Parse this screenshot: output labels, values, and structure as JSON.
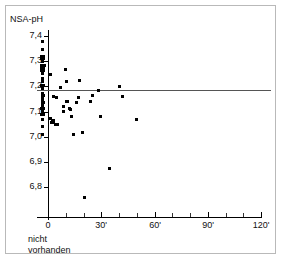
{
  "figure": {
    "kind": "scatter-plot",
    "background_color": "#ffffff",
    "frame_color": "#b9b9b9"
  },
  "labels": {
    "y_axis_title": "NSA-pH",
    "below_origin_line1": "nicht",
    "below_origin_line2": "vorhanden"
  },
  "chart_data": {
    "type": "scatter",
    "title": "",
    "subtitle": "",
    "xlabel": "",
    "ylabel": "NSA-pH",
    "grid": false,
    "legend": null,
    "xlim": [
      -12,
      128
    ],
    "ylim": [
      6.74,
      7.45
    ],
    "x_tick_labels": [
      "0",
      "30'",
      "60'",
      "90'",
      "120'"
    ],
    "x_tick_values": [
      0,
      30,
      60,
      90,
      120
    ],
    "x_minor_tick_values": [
      10,
      20,
      40,
      50,
      70,
      80,
      100,
      110
    ],
    "y_tick_labels": [
      "7,4",
      "7,3",
      "7,2",
      "7,1",
      "7,0",
      "6,9",
      "6,8"
    ],
    "y_tick_values": [
      7.4,
      7.3,
      7.2,
      7.1,
      7.0,
      6.9,
      6.8
    ],
    "annotations": [
      {
        "name": "reference-line",
        "kind": "horizontal-line",
        "y": 7.2,
        "color": "#555555",
        "label": ""
      },
      {
        "name": "category-axis-note",
        "kind": "text",
        "text": "nicht vorhanden",
        "x": 0,
        "y": 6.76
      }
    ],
    "series": [
      {
        "name": "NSA-pH measurements",
        "marker": "square",
        "color": "#000000",
        "points": [
          [
            -3.0,
            7.38
          ],
          [
            -3.0,
            7.345
          ],
          [
            -3.4,
            7.318
          ],
          [
            -2.6,
            7.318
          ],
          [
            -3.4,
            7.31
          ],
          [
            -2.6,
            7.31
          ],
          [
            -3.0,
            7.3
          ],
          [
            -3.8,
            7.283
          ],
          [
            -3.0,
            7.283
          ],
          [
            -2.2,
            7.283
          ],
          [
            -3.4,
            7.272
          ],
          [
            -2.6,
            7.272
          ],
          [
            -3.4,
            7.262
          ],
          [
            -2.6,
            7.262
          ],
          [
            -3.0,
            7.25
          ],
          [
            1.5,
            7.248
          ],
          [
            -3.0,
            7.232
          ],
          [
            -3.0,
            7.218
          ],
          [
            -3.4,
            7.203
          ],
          [
            -2.6,
            7.203
          ],
          [
            -3.0,
            7.19
          ],
          [
            -3.0,
            7.172
          ],
          [
            -2.4,
            7.162
          ],
          [
            -3.2,
            7.16
          ],
          [
            -3.0,
            7.148
          ],
          [
            -3.2,
            7.138
          ],
          [
            -2.4,
            7.138
          ],
          [
            -3.0,
            7.126
          ],
          [
            -3.4,
            7.112
          ],
          [
            -2.6,
            7.112
          ],
          [
            -3.0,
            7.1
          ],
          [
            -3.4,
            7.09
          ],
          [
            -2.6,
            7.09
          ],
          [
            -3.0,
            7.07
          ],
          [
            -3.0,
            7.04
          ],
          [
            -3.0,
            7.008
          ],
          [
            3.0,
            7.16
          ],
          [
            4.6,
            7.155
          ],
          [
            1.6,
            7.072
          ],
          [
            2.4,
            7.066
          ],
          [
            3.2,
            7.064
          ],
          [
            2.0,
            7.058
          ],
          [
            3.0,
            7.056
          ],
          [
            4.0,
            7.05
          ],
          [
            5.2,
            7.048
          ],
          [
            7.0,
            7.196
          ],
          [
            8.6,
            7.122
          ],
          [
            9.0,
            7.1
          ],
          [
            10.0,
            7.268
          ],
          [
            10.2,
            7.22
          ],
          [
            10.4,
            7.142
          ],
          [
            11.0,
            7.14
          ],
          [
            12.2,
            7.114
          ],
          [
            12.6,
            7.11
          ],
          [
            13.0,
            7.082
          ],
          [
            14.6,
            7.01
          ],
          [
            16.0,
            7.138
          ],
          [
            17.0,
            7.155
          ],
          [
            18.0,
            7.222
          ],
          [
            19.4,
            7.016
          ],
          [
            20.6,
            6.758
          ],
          [
            24.0,
            7.14
          ],
          [
            25.0,
            7.164
          ],
          [
            28.6,
            7.182
          ],
          [
            29.4,
            7.08
          ],
          [
            34.6,
            6.876
          ],
          [
            40.0,
            7.2
          ],
          [
            42.0,
            7.16
          ],
          [
            50.0,
            7.068
          ]
        ]
      }
    ]
  }
}
